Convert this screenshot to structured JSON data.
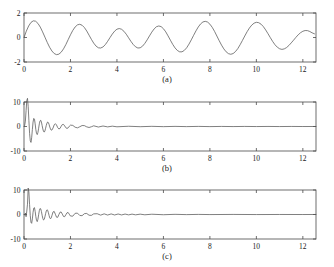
{
  "figure": {
    "background_color": "#ffffff",
    "line_color": "#555555",
    "axis_color": "#4a4a4a",
    "text_color": "#1a1a1a"
  },
  "panels": [
    {
      "id": "a",
      "caption": "(a)",
      "xticklabels": [
        "0",
        "2",
        "4",
        "6",
        "8",
        "10",
        "12"
      ],
      "yticklabels": [
        "2",
        "0",
        "-2"
      ]
    },
    {
      "id": "b",
      "caption": "(b)",
      "xticklabels": [
        "0",
        "2",
        "4",
        "6",
        "8",
        "10",
        "12"
      ],
      "yticklabels": [
        "10",
        "0",
        "-10"
      ]
    },
    {
      "id": "c",
      "caption": "(c)",
      "xticklabels": [
        "0",
        "2",
        "4",
        "6",
        "8",
        "10",
        "12"
      ],
      "yticklabels": [
        "10",
        "0",
        "-10"
      ]
    }
  ],
  "chart_data": [
    {
      "type": "line",
      "title": "",
      "subtitle": "(a)",
      "xlabel": "",
      "ylabel": "",
      "xlim": [
        0,
        12.566
      ],
      "ylim": [
        -2,
        2
      ],
      "xticks": [
        0,
        2,
        4,
        6,
        8,
        10,
        12
      ],
      "yticks": [
        -2,
        0,
        2
      ],
      "grid": false,
      "legend": null,
      "description": "Beating / amplitude-modulated signal: sum of two close-frequency sinusoids, x from 0 to 4*pi",
      "series": [
        {
          "name": "signal",
          "color": "#555555",
          "x": [
            0.0,
            0.1,
            0.2,
            0.3,
            0.4,
            0.5,
            0.6,
            0.7,
            0.8,
            0.9,
            1.0,
            1.1,
            1.2,
            1.3,
            1.4,
            1.5,
            1.6,
            1.7,
            1.8,
            1.9,
            2.0,
            2.1,
            2.2,
            2.3,
            2.4,
            2.5,
            2.6,
            2.7,
            2.8,
            2.9,
            3.0,
            3.1,
            3.2,
            3.3,
            3.4,
            3.5,
            3.6,
            3.7,
            3.8,
            3.9,
            4.0,
            4.1,
            4.2,
            4.3,
            4.4,
            4.5,
            4.6,
            4.7,
            4.8,
            4.9,
            5.0,
            5.1,
            5.2,
            5.3,
            5.4,
            5.5,
            5.6,
            5.7,
            5.8,
            5.9,
            6.0,
            6.1,
            6.2,
            6.3,
            6.4,
            6.5,
            6.6,
            6.7,
            6.8,
            6.9,
            7.0,
            7.1,
            7.2,
            7.3,
            7.4,
            7.5,
            7.6,
            7.7,
            7.8,
            7.9,
            8.0,
            8.1,
            8.2,
            8.3,
            8.4,
            8.5,
            8.6,
            8.7,
            8.8,
            8.9,
            9.0,
            9.1,
            9.2,
            9.3,
            9.4,
            9.5,
            9.6,
            9.7,
            9.8,
            9.9,
            10.0,
            10.1,
            10.2,
            10.3,
            10.4,
            10.5,
            10.6,
            10.7,
            10.8,
            10.9,
            11.0,
            11.1,
            11.2,
            11.3,
            11.4,
            11.5,
            11.6,
            11.7,
            11.8,
            11.9,
            12.0,
            12.1,
            12.2,
            12.3,
            12.4,
            12.5,
            12.566
          ],
          "y": [
            0.0,
            0.52,
            0.94,
            1.23,
            1.36,
            1.33,
            1.15,
            0.85,
            0.46,
            0.03,
            -0.4,
            -0.79,
            -1.1,
            -1.31,
            -1.4,
            -1.36,
            -1.2,
            -0.93,
            -0.58,
            -0.18,
            0.22,
            0.58,
            0.86,
            1.03,
            1.08,
            1.0,
            0.81,
            0.53,
            0.19,
            -0.15,
            -0.46,
            -0.7,
            -0.84,
            -0.86,
            -0.77,
            -0.58,
            -0.31,
            -0.01,
            0.28,
            0.52,
            0.68,
            0.73,
            0.67,
            0.51,
            0.27,
            -0.02,
            -0.31,
            -0.57,
            -0.76,
            -0.86,
            -0.84,
            -0.71,
            -0.48,
            -0.19,
            0.13,
            0.44,
            0.7,
            0.88,
            0.94,
            0.89,
            0.72,
            0.46,
            0.13,
            -0.22,
            -0.56,
            -0.85,
            -1.06,
            -1.17,
            -1.17,
            -1.05,
            -0.84,
            -0.54,
            -0.19,
            0.18,
            0.54,
            0.86,
            1.11,
            1.27,
            1.32,
            1.26,
            1.09,
            0.83,
            0.5,
            0.12,
            -0.26,
            -0.62,
            -0.93,
            -1.17,
            -1.32,
            -1.37,
            -1.31,
            -1.15,
            -0.91,
            -0.59,
            -0.24,
            0.12,
            0.47,
            0.77,
            1.01,
            1.17,
            1.24,
            1.21,
            1.09,
            0.89,
            0.62,
            0.31,
            -0.01,
            -0.32,
            -0.59,
            -0.79,
            -0.92,
            -0.97,
            -0.93,
            -0.82,
            -0.65,
            -0.44,
            -0.22,
            0.01,
            0.22,
            0.39,
            0.51,
            0.57,
            0.56,
            0.49,
            0.38,
            0.3
          ]
        }
      ]
    },
    {
      "type": "line",
      "title": "",
      "subtitle": "(b)",
      "xlabel": "",
      "ylabel": "",
      "xlim": [
        0,
        12.566
      ],
      "ylim": [
        -10,
        10
      ],
      "xticks": [
        0,
        2,
        4,
        6,
        8,
        10,
        12
      ],
      "yticks": [
        -10,
        0,
        10
      ],
      "grid": false,
      "legend": null,
      "description": "Decaying oscillatory transient. Positive peak about +11.5 near x=0.15, negative dip about -6.5 near x=0.35, ripples decay to near zero by x=3",
      "series": [
        {
          "name": "transient-b",
          "color": "#555555",
          "x": [
            0.0,
            0.03,
            0.06,
            0.09,
            0.12,
            0.15,
            0.18,
            0.21,
            0.24,
            0.27,
            0.3,
            0.33,
            0.36,
            0.39,
            0.42,
            0.45,
            0.48,
            0.51,
            0.54,
            0.57,
            0.6,
            0.63,
            0.66,
            0.69,
            0.72,
            0.75,
            0.78,
            0.81,
            0.84,
            0.87,
            0.9,
            0.93,
            0.96,
            0.99,
            1.02,
            1.05,
            1.08,
            1.11,
            1.14,
            1.17,
            1.2,
            1.25,
            1.3,
            1.35,
            1.4,
            1.45,
            1.5,
            1.55,
            1.6,
            1.65,
            1.7,
            1.75,
            1.8,
            1.85,
            1.9,
            1.95,
            2.0,
            2.1,
            2.2,
            2.3,
            2.4,
            2.5,
            2.6,
            2.7,
            2.8,
            2.9,
            3.0,
            3.2,
            3.4,
            3.6,
            3.8,
            4.0,
            4.5,
            5.0,
            5.5,
            6.0,
            6.5,
            7.0,
            7.5,
            8.0,
            8.5,
            9.0,
            9.5,
            10.0,
            10.5,
            11.0,
            11.5,
            12.0,
            12.566
          ],
          "y": [
            0.0,
            0.5,
            2.2,
            6.5,
            10.6,
            11.5,
            8.2,
            2.5,
            -2.8,
            -5.8,
            -6.5,
            -4.6,
            -1.2,
            1.8,
            3.3,
            3.0,
            1.1,
            -1.3,
            -2.9,
            -3.3,
            -2.4,
            -0.7,
            1.1,
            2.3,
            2.55,
            1.8,
            0.4,
            -1.0,
            -2.0,
            -2.3,
            -1.8,
            -0.7,
            0.5,
            1.4,
            1.85,
            1.6,
            0.8,
            -0.2,
            -1.05,
            -1.5,
            -1.45,
            -0.6,
            0.7,
            1.15,
            0.6,
            -0.45,
            -1.0,
            -0.8,
            0.1,
            0.8,
            0.85,
            0.25,
            -0.5,
            -0.8,
            -0.55,
            0.1,
            0.55,
            0.45,
            -0.3,
            -0.55,
            -0.1,
            0.4,
            0.35,
            -0.15,
            -0.4,
            -0.1,
            0.28,
            -0.22,
            0.2,
            -0.16,
            0.14,
            -0.12,
            0.1,
            -0.08,
            0.07,
            -0.06,
            0.05,
            -0.05,
            0.04,
            -0.04,
            0.03,
            -0.03,
            0.03,
            -0.02,
            0.02,
            -0.02,
            0.02,
            -0.01,
            0.0
          ]
        }
      ]
    },
    {
      "type": "line",
      "title": "",
      "subtitle": "(c)",
      "xlabel": "",
      "ylabel": "",
      "xlim": [
        0,
        12.566
      ],
      "ylim": [
        -10,
        10
      ],
      "xticks": [
        0,
        2,
        4,
        6,
        8,
        10,
        12
      ],
      "yticks": [
        -10,
        0,
        10
      ],
      "grid": false,
      "legend": null,
      "description": "Decaying oscillatory transient with narrower initial spike (about +10.8 near x=0.18) and longer-lived small ripples extending to about x=5",
      "series": [
        {
          "name": "transient-c",
          "color": "#555555",
          "x": [
            0.0,
            0.03,
            0.06,
            0.09,
            0.12,
            0.15,
            0.18,
            0.21,
            0.24,
            0.27,
            0.3,
            0.33,
            0.36,
            0.39,
            0.42,
            0.45,
            0.48,
            0.51,
            0.54,
            0.57,
            0.6,
            0.63,
            0.66,
            0.69,
            0.72,
            0.75,
            0.78,
            0.81,
            0.84,
            0.87,
            0.9,
            0.93,
            0.96,
            0.99,
            1.02,
            1.05,
            1.08,
            1.11,
            1.14,
            1.17,
            1.2,
            1.25,
            1.3,
            1.35,
            1.4,
            1.45,
            1.5,
            1.55,
            1.6,
            1.65,
            1.7,
            1.75,
            1.8,
            1.85,
            1.9,
            1.95,
            2.0,
            2.1,
            2.2,
            2.3,
            2.4,
            2.5,
            2.6,
            2.7,
            2.8,
            2.9,
            3.0,
            3.15,
            3.3,
            3.45,
            3.6,
            3.75,
            3.9,
            4.05,
            4.2,
            4.35,
            4.5,
            4.65,
            4.8,
            5.0,
            5.2,
            5.5,
            6.0,
            6.5,
            7.0,
            7.5,
            8.0,
            9.0,
            10.0,
            11.0,
            12.0,
            12.566
          ],
          "y": [
            0.0,
            -0.3,
            0.6,
            -0.9,
            1.4,
            4.2,
            10.8,
            9.2,
            4.0,
            -0.5,
            -3.2,
            -3.6,
            -1.8,
            0.9,
            2.6,
            2.8,
            1.3,
            -0.9,
            -2.5,
            -2.9,
            -1.9,
            -0.1,
            1.6,
            2.45,
            2.3,
            1.2,
            -0.3,
            -1.6,
            -2.25,
            -2.0,
            -0.95,
            0.35,
            1.45,
            1.95,
            1.7,
            0.75,
            -0.45,
            -1.4,
            -1.75,
            -1.4,
            -0.5,
            1.05,
            1.25,
            0.1,
            -1.1,
            -1.15,
            -0.05,
            0.95,
            1.0,
            0.15,
            -0.8,
            -0.9,
            -0.1,
            0.7,
            0.8,
            0.1,
            -0.62,
            -0.68,
            0.48,
            0.55,
            -0.4,
            -0.48,
            0.34,
            0.42,
            -0.3,
            -0.36,
            0.26,
            0.32,
            -0.26,
            0.27,
            -0.23,
            0.24,
            -0.2,
            0.21,
            -0.18,
            0.18,
            -0.16,
            0.16,
            -0.14,
            0.14,
            -0.12,
            0.11,
            -0.09,
            0.07,
            -0.05,
            0.04,
            -0.03,
            0.03,
            -0.02,
            0.01,
            -0.01,
            0.01,
            0.0
          ]
        }
      ]
    }
  ]
}
